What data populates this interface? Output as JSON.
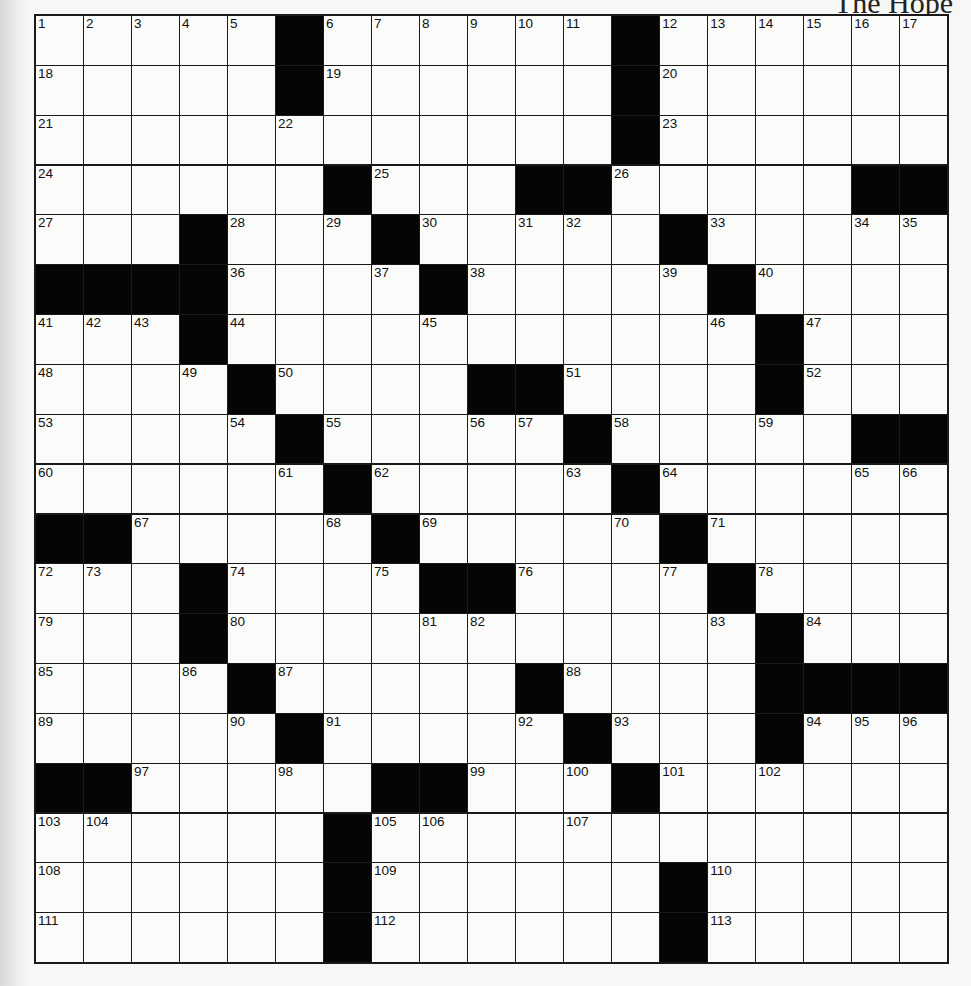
{
  "header": {
    "title": "The Hope"
  },
  "puzzle": {
    "rows": 19,
    "cols": 19,
    "colors": {
      "black": "#050505",
      "white": "#fbfbfa",
      "line": "#1a1a1a"
    },
    "grid": [
      [
        "1",
        "2",
        "3",
        "4",
        "5",
        "#",
        "6",
        "7",
        "8",
        "9",
        "10",
        "11",
        "#",
        "12",
        "13",
        "14",
        "15",
        "16",
        "17"
      ],
      [
        "18",
        ".",
        ".",
        ".",
        ".",
        "#",
        "19",
        ".",
        ".",
        ".",
        ".",
        ".",
        "#",
        "20",
        ".",
        ".",
        ".",
        ".",
        "."
      ],
      [
        "21",
        ".",
        ".",
        ".",
        ".",
        "22",
        ".",
        ".",
        ".",
        ".",
        ".",
        ".",
        "#",
        "23",
        ".",
        ".",
        ".",
        ".",
        "."
      ],
      [
        "24",
        ".",
        ".",
        ".",
        ".",
        ".",
        "#",
        "25",
        ".",
        ".",
        "#",
        "#",
        "26",
        ".",
        ".",
        ".",
        ".",
        "#",
        "#"
      ],
      [
        "27",
        ".",
        ".",
        "#",
        "28",
        ".",
        "29",
        "#",
        "30",
        ".",
        "31",
        "32",
        ".",
        "#",
        "33",
        ".",
        ".",
        "34",
        "35"
      ],
      [
        "#",
        "#",
        "#",
        "#",
        "36",
        ".",
        ".",
        "37",
        "#",
        "38",
        ".",
        ".",
        ".",
        "39",
        "#",
        "40",
        ".",
        ".",
        "."
      ],
      [
        "41",
        "42",
        "43",
        "#",
        "44",
        ".",
        ".",
        ".",
        "45",
        ".",
        ".",
        ".",
        ".",
        ".",
        "46",
        "#",
        "47",
        ".",
        "."
      ],
      [
        "48",
        ".",
        ".",
        "49",
        "#",
        "50",
        ".",
        ".",
        ".",
        "#",
        "#",
        "51",
        ".",
        ".",
        ".",
        "#",
        "52",
        ".",
        "."
      ],
      [
        "53",
        ".",
        ".",
        ".",
        "54",
        "#",
        "55",
        ".",
        ".",
        "56",
        "57",
        "#",
        "58",
        ".",
        ".",
        "59",
        ".",
        "#",
        "#"
      ],
      [
        "60",
        ".",
        ".",
        ".",
        ".",
        "61",
        "#",
        "62",
        ".",
        ".",
        ".",
        "63",
        "#",
        "64",
        ".",
        ".",
        ".",
        "65",
        "66"
      ],
      [
        "#",
        "#",
        "67",
        ".",
        ".",
        ".",
        "68",
        "#",
        "69",
        ".",
        ".",
        ".",
        "70",
        "#",
        "71",
        ".",
        ".",
        ".",
        "."
      ],
      [
        "72",
        "73",
        ".",
        "#",
        "74",
        ".",
        ".",
        "75",
        "#",
        "#",
        "76",
        ".",
        ".",
        "77",
        "#",
        "78",
        ".",
        ".",
        "."
      ],
      [
        "79",
        ".",
        ".",
        "#",
        "80",
        ".",
        ".",
        ".",
        "81",
        "82",
        ".",
        ".",
        ".",
        ".",
        "83",
        "#",
        "84",
        ".",
        "."
      ],
      [
        "85",
        ".",
        ".",
        "86",
        "#",
        "87",
        ".",
        ".",
        ".",
        ".",
        "#",
        "88",
        ".",
        ".",
        ".",
        "#",
        "#",
        "#",
        "#"
      ],
      [
        "89",
        ".",
        ".",
        ".",
        "90",
        "#",
        "91",
        ".",
        ".",
        ".",
        "92",
        "#",
        "93",
        ".",
        ".",
        "#",
        "94",
        "95",
        "96"
      ],
      [
        "#",
        "#",
        "97",
        ".",
        ".",
        "98",
        ".",
        "#",
        "#",
        "99",
        ".",
        "100",
        "#",
        "101",
        ".",
        "102",
        ".",
        ".",
        "."
      ],
      [
        "103",
        "104",
        ".",
        ".",
        ".",
        ".",
        "#",
        "105",
        "106",
        ".",
        ".",
        "107",
        ".",
        ".",
        ".",
        ".",
        ".",
        ".",
        "."
      ],
      [
        "108",
        ".",
        ".",
        ".",
        ".",
        ".",
        "#",
        "109",
        ".",
        ".",
        ".",
        ".",
        ".",
        "#",
        "110",
        ".",
        ".",
        ".",
        "."
      ],
      [
        "111",
        ".",
        ".",
        ".",
        ".",
        ".",
        "#",
        "112",
        ".",
        ".",
        ".",
        ".",
        ".",
        "#",
        "113",
        ".",
        ".",
        ".",
        "."
      ]
    ]
  }
}
